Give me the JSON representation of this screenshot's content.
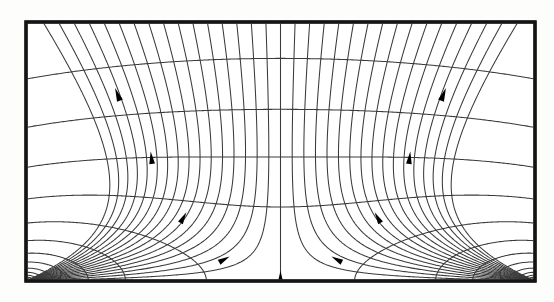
{
  "figure": {
    "title": "Flow net diagram",
    "background_color": "#fdfdfc",
    "line_color": "#3a3a3a",
    "frame_color": "#141414",
    "arrow_color": "#000000"
  },
  "frame": {
    "x": 26,
    "y": 22,
    "width": 509,
    "height": 259,
    "stroke_width": 3.2
  },
  "chart_data": {
    "type": "line",
    "title": "Flow net diagram",
    "subtitle": "",
    "xlabel": "",
    "ylabel": "",
    "grid": true,
    "legend": "none",
    "xlim": [
      0,
      1
    ],
    "ylim": [
      0,
      1
    ],
    "sources": [
      {
        "name": "left-corner-source",
        "x": 0.0,
        "y": 1.0
      },
      {
        "name": "right-corner-source",
        "x": 1.0,
        "y": 1.0
      }
    ],
    "series": [
      {
        "name": "streamlines",
        "count": 34,
        "description": "curved lines fanning from bottom corners to top edge"
      },
      {
        "name": "equipotentials",
        "count": 22,
        "description": "arcs orthogonal to the streamlines"
      }
    ]
  },
  "geometry": {
    "streamline_count": 34,
    "equipotential_count": 22,
    "u_min": 0.012,
    "u_max": 0.988,
    "v_min": 0.05,
    "v_max": 1.62,
    "curvature": 1.0
  },
  "arrows": [
    {
      "id": "arrow-upper-left",
      "u": 0.175,
      "v": 0.255,
      "size": 13.5
    },
    {
      "id": "arrow-mid-left",
      "u": 0.245,
      "v": 0.5,
      "size": 12.5
    },
    {
      "id": "arrow-lower-left",
      "u": 0.315,
      "v": 0.735,
      "size": 12.0
    },
    {
      "id": "arrow-bottom-left",
      "u": 0.4,
      "v": 0.905,
      "size": 12.0
    },
    {
      "id": "arrow-bottom-center",
      "u": 0.5,
      "v": 0.96,
      "size": 13.0
    },
    {
      "id": "arrow-bottom-right",
      "u": 0.6,
      "v": 0.905,
      "size": 12.0
    },
    {
      "id": "arrow-lower-right",
      "u": 0.685,
      "v": 0.735,
      "size": 12.0
    },
    {
      "id": "arrow-mid-right",
      "u": 0.755,
      "v": 0.5,
      "size": 12.5
    },
    {
      "id": "arrow-upper-right",
      "u": 0.825,
      "v": 0.255,
      "size": 13.5
    }
  ]
}
